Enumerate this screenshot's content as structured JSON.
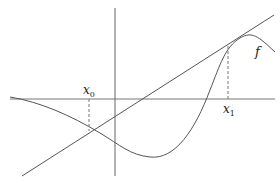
{
  "diagram": {
    "labels": {
      "x0": {
        "base": "x",
        "sub": "0"
      },
      "x1": {
        "base": "x",
        "sub": "1"
      },
      "function": "f"
    },
    "colors": {
      "stroke": "#555555",
      "axis": "#666666",
      "dashed": "#777777"
    }
  }
}
